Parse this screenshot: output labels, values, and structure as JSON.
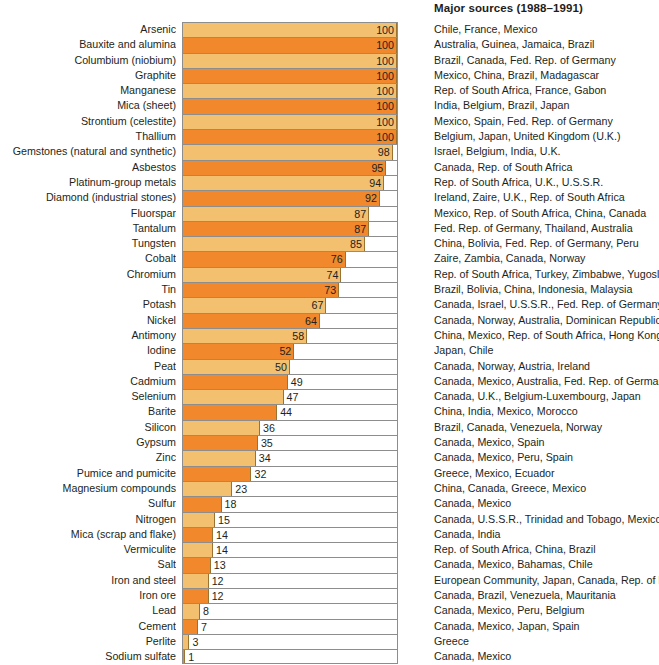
{
  "header": {
    "sources_title": "Major sources (1988–1991)"
  },
  "chart_data": {
    "type": "bar",
    "orientation": "horizontal",
    "title": "",
    "xlabel": "",
    "ylabel": "",
    "xlim": [
      0,
      100
    ],
    "grid": false,
    "legend": false,
    "value_unit": "percent",
    "extra_column_header": "Major sources (1988–1991)",
    "categories": [
      "Arsenic",
      "Bauxite and alumina",
      "Columbium (niobium)",
      "Graphite",
      "Manganese",
      "Mica (sheet)",
      "Strontium (celestite)",
      "Thallium",
      "Gemstones (natural and synthetic)",
      "Asbestos",
      "Platinum-group metals",
      "Diamond (industrial stones)",
      "Fluorspar",
      "Tantalum",
      "Tungsten",
      "Cobalt",
      "Chromium",
      "Tin",
      "Potash",
      "Nickel",
      "Antimony",
      "Iodine",
      "Peat",
      "Cadmium",
      "Selenium",
      "Barite",
      "Silicon",
      "Gypsum",
      "Zinc",
      "Pumice and pumicite",
      "Magnesium compounds",
      "Sulfur",
      "Nitrogen",
      "Mica (scrap and flake)",
      "Vermiculite",
      "Salt",
      "Iron and steel",
      "Iron ore",
      "Lead",
      "Cement",
      "Perlite",
      "Sodium sulfate"
    ],
    "values": [
      100,
      100,
      100,
      100,
      100,
      100,
      100,
      100,
      98,
      95,
      94,
      92,
      87,
      87,
      85,
      76,
      74,
      73,
      67,
      64,
      58,
      52,
      50,
      49,
      47,
      44,
      36,
      35,
      34,
      32,
      23,
      18,
      15,
      14,
      14,
      13,
      12,
      12,
      8,
      7,
      3,
      1
    ],
    "sources": [
      "Chile, France, Mexico",
      "Australia, Guinea, Jamaica, Brazil",
      "Brazil, Canada, Fed. Rep. of Germany",
      "Mexico, China, Brazil, Madagascar",
      "Rep. of South Africa, France, Gabon",
      "India, Belgium, Brazil, Japan",
      "Mexico, Spain, Fed. Rep. of Germany",
      "Belgium, Japan, United Kingdom (U.K.)",
      "Israel, Belgium, India, U.K.",
      "Canada, Rep. of South Africa",
      "Rep. of South Africa, U.K., U.S.S.R.",
      "Ireland, Zaire, U.K., Rep. of South Africa",
      "Mexico, Rep. of South Africa, China, Canada",
      "Fed. Rep. of Germany, Thailand, Australia",
      "China, Bolivia, Fed. Rep. of Germany, Peru",
      "Zaire, Zambia, Canada, Norway",
      "Rep. of South Africa, Turkey, Zimbabwe, Yugoslavia",
      "Brazil, Bolivia, China, Indonesia, Malaysia",
      "Canada, Israel, U.S.S.R., Fed. Rep. of Germany",
      "Canada, Norway, Australia, Dominican Republic",
      "China, Mexico, Rep. of South Africa, Hong Kong",
      "Japan, Chile",
      "Canada, Norway, Austria, Ireland",
      "Canada, Mexico, Australia, Fed. Rep. of Germany",
      "Canada, U.K., Belgium-Luxembourg, Japan",
      "China, India, Mexico, Morocco",
      "Brazil, Canada, Venezuela, Norway",
      "Canada, Mexico, Spain",
      "Canada, Mexico, Peru, Spain",
      "Greece, Mexico, Ecuador",
      "China, Canada, Greece, Mexico",
      "Canada, Mexico",
      "Canada, U.S.S.R., Trinidad and Tobago, Mexico",
      "Canada, India",
      "Rep. of South Africa, China, Brazil",
      "Canada, Mexico, Bahamas, Chile",
      "European Community, Japan, Canada, Rep. of Korea",
      "Canada, Brazil, Venezuela, Mauritania",
      "Canada, Mexico, Peru, Belgium",
      "Canada, Mexico, Japan, Spain",
      "Greece",
      "Canada, Mexico"
    ]
  },
  "colors": {
    "bar_light": "#f3c070",
    "bar_dark": "#f1892c",
    "bar_edge": "#9a7232",
    "frame": "#8d8d8d",
    "text": "#231f20",
    "background": "#ffffff"
  }
}
